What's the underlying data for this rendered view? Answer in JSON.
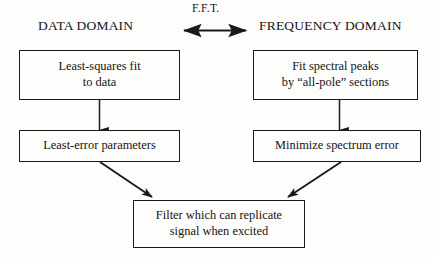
{
  "diagram": {
    "title_left": "DATA DOMAIN",
    "title_right": "FREQUENCY DOMAIN",
    "transform_label": "F.F.T.",
    "boxes": {
      "least_squares_fit": "Least-squares fit\nto data",
      "least_error_parameters": "Least-error parameters",
      "fit_spectral_peaks": "Fit spectral peaks\nby “all-pole” sections",
      "minimize_spectrum_error": "Minimize spectrum error",
      "filter_result": "Filter which can replicate\nsignal when excited"
    },
    "colors": {
      "background": "#fdfdfc",
      "stroke": "#1a1a1a",
      "text": "#141414"
    }
  }
}
